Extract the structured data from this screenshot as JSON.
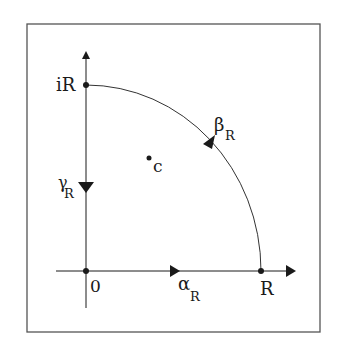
{
  "diagram": {
    "points": {
      "origin": "0",
      "imag_point": "iR",
      "real_point": "R",
      "interior_point": "c"
    },
    "paths": {
      "alpha": {
        "symbol": "α",
        "subscript": "R",
        "description": "segment from 0 to R along real axis"
      },
      "beta": {
        "symbol": "β",
        "subscript": "R",
        "description": "arc from R to iR"
      },
      "gamma": {
        "symbol": "γ",
        "subscript": "R",
        "description": "segment from iR to 0 along imaginary axis"
      }
    },
    "colors": {
      "stroke": "#1a1a1a",
      "frame": "#555555",
      "background": "#ffffff"
    }
  }
}
